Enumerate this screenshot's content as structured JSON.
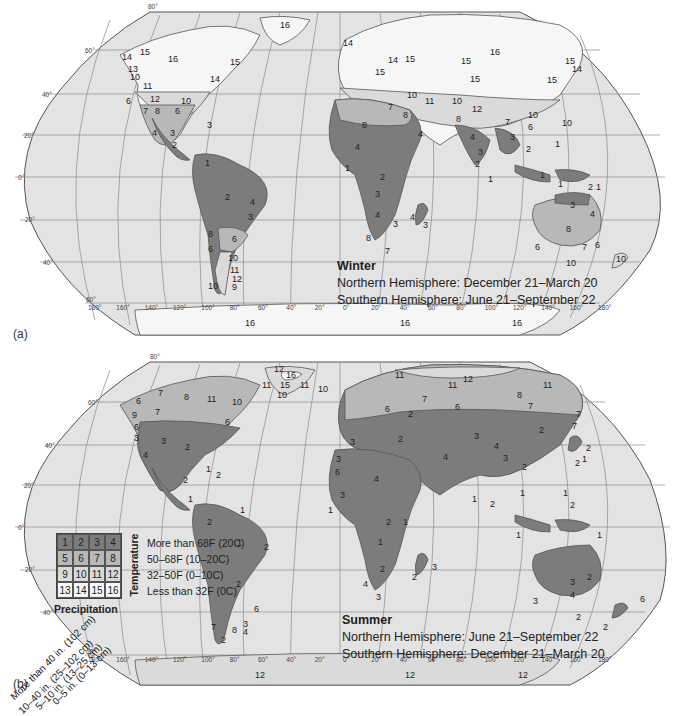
{
  "panels": [
    {
      "id": "a",
      "panel_label": "(a)",
      "season": "Winter",
      "line1": "Northern Hemisphere: December 21–March 20",
      "line2": "Southern Hemisphere: June 21–September 22",
      "region_numbers": {
        "north_america": [
          "16",
          "14",
          "15",
          "14",
          "14",
          "16",
          "15",
          "14",
          "13",
          "10",
          "11",
          "12",
          "11",
          "10",
          "6",
          "7",
          "8",
          "6",
          "4",
          "4",
          "3",
          "2",
          "3",
          "3"
        ],
        "south_america": [
          "1",
          "1",
          "2",
          "4",
          "3",
          "8",
          "6",
          "6",
          "10",
          "11",
          "12",
          "9",
          "10"
        ],
        "europe_asia": [
          "14",
          "15",
          "14",
          "15",
          "15",
          "15",
          "16",
          "15",
          "15",
          "14",
          "11",
          "11",
          "10",
          "6",
          "11",
          "10",
          "11",
          "12",
          "11",
          "10",
          "10",
          "7",
          "6",
          "8",
          "7",
          "7",
          "8",
          "8",
          "8",
          "8",
          "6",
          "7",
          "4",
          "4",
          "3",
          "3",
          "2",
          "2",
          "1"
        ],
        "africa": [
          "8",
          "4",
          "4",
          "1",
          "2",
          "3",
          "4",
          "3",
          "8",
          "7",
          "4",
          "3"
        ],
        "oceania": [
          "1",
          "1",
          "1",
          "2",
          "1",
          "3",
          "4",
          "8",
          "6",
          "7",
          "6",
          "10",
          "10"
        ],
        "antarctica": [
          "16",
          "16",
          "16"
        ]
      }
    },
    {
      "id": "b",
      "panel_label": "(b)",
      "season": "Summer",
      "line1": "Northern Hemisphere: June 21–September 22",
      "line2": "Southern Hemisphere: December 21–March 20",
      "region_numbers": {
        "north_america": [
          "12",
          "16",
          "11",
          "15",
          "11",
          "10",
          "10",
          "7",
          "8",
          "11",
          "10",
          "6",
          "6",
          "7",
          "9",
          "7",
          "6",
          "3",
          "3",
          "4",
          "2",
          "1",
          "2",
          "2",
          "1"
        ],
        "south_america": [
          "2",
          "1",
          "1",
          "2",
          "2",
          "6",
          "3",
          "4",
          "7",
          "8",
          "2"
        ],
        "europe_asia": [
          "11",
          "12",
          "11",
          "11",
          "8",
          "7",
          "6",
          "7",
          "6",
          "2",
          "7",
          "7",
          "3",
          "2",
          "2",
          "4",
          "3",
          "4",
          "2",
          "2",
          "1",
          "2",
          "1",
          "1",
          "2",
          "1",
          "1",
          "6"
        ],
        "africa": [
          "3",
          "3",
          "4",
          "3",
          "1",
          "2",
          "1",
          "1",
          "2",
          "4",
          "3",
          "2",
          "3"
        ],
        "oceania": [
          "1",
          "1",
          "1",
          "3",
          "2",
          "4",
          "3",
          "2",
          "2",
          "6",
          "2"
        ],
        "antarctica": [
          "12",
          "12",
          "12"
        ]
      }
    }
  ],
  "graticule": {
    "latitudes": [
      "80°",
      "60°",
      "40°",
      "20°",
      "0°",
      "20°",
      "40°",
      "60°"
    ],
    "longitudes": [
      "180°",
      "160°",
      "140°",
      "120°",
      "100°",
      "80°",
      "60°",
      "40°",
      "20°",
      "0°",
      "20°",
      "40°",
      "60°",
      "80°",
      "100°",
      "120°",
      "140°",
      "160°",
      "180°"
    ]
  },
  "legend": {
    "cells": [
      "1",
      "2",
      "3",
      "4",
      "5",
      "6",
      "7",
      "8",
      "9",
      "10",
      "11",
      "12",
      "13",
      "14",
      "15",
      "16"
    ],
    "row_shades": [
      "#7c7c7c",
      "#b8b8b8",
      "#dadada",
      "#f6f6f6"
    ],
    "temperature_axis": "Temperature",
    "temperature_labels": [
      "More than 68F (20C)",
      "50–68F (10–20C)",
      "32–50F (0–10C)",
      "Less than 32F (0C)"
    ],
    "precipitation_axis": "Precipitation",
    "precipitation_labels": [
      "More than 40 in. (102 cm)",
      "10–40 in. (25–102 cm)",
      "5–10 in. (13–25 cm)",
      "0–5 in. (0–13 cm)"
    ]
  },
  "colors": {
    "ocean": "#e3e3e3",
    "grid": "#8a8a8a",
    "dark": "#7c7c7c",
    "mid": "#b8b8b8",
    "light": "#dadada",
    "white": "#f6f6f6"
  }
}
